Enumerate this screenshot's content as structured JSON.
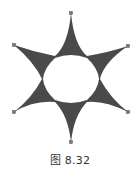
{
  "figure": {
    "shape": "six-pointed-star-curved",
    "fill_color": "#4a4a4a",
    "handle_color": "#666666",
    "center": [
      71,
      79
    ],
    "outer_points": [
      [
        71,
        13
      ],
      [
        128,
        46
      ],
      [
        128,
        112
      ],
      [
        71,
        142
      ],
      [
        14,
        112
      ],
      [
        14,
        45
      ]
    ],
    "inner_points": [
      [
        85,
        57
      ],
      [
        102,
        68
      ],
      [
        102,
        92
      ],
      [
        85,
        103
      ],
      [
        57,
        103
      ],
      [
        40,
        92
      ],
      [
        40,
        68
      ],
      [
        57,
        57
      ]
    ]
  },
  "caption": {
    "text": "图 8.32"
  }
}
